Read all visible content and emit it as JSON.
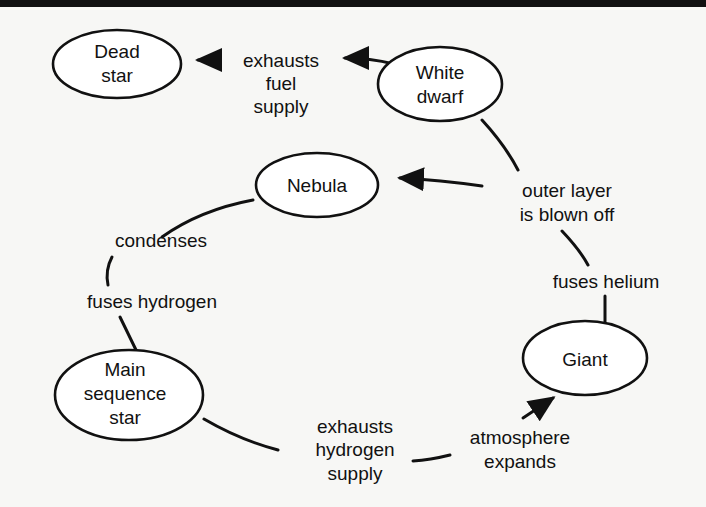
{
  "nodes": {
    "dead_star": [
      "Dead",
      "star"
    ],
    "white_dwarf": [
      "White",
      "dwarf"
    ],
    "nebula": [
      "Nebula"
    ],
    "main_sequence": [
      "Main",
      "sequence",
      "star"
    ],
    "giant": [
      "Giant"
    ]
  },
  "edges": {
    "exhausts_fuel": [
      "exhausts",
      "fuel",
      "supply"
    ],
    "outer_layer": [
      "outer layer",
      "is blown off"
    ],
    "condenses": [
      "condenses"
    ],
    "fuses_hydrogen": [
      "fuses hydrogen"
    ],
    "fuses_helium": [
      "fuses helium"
    ],
    "exhausts_hydrogen": [
      "exhausts",
      "hydrogen",
      "supply"
    ],
    "atmosphere": [
      "atmosphere",
      "expands"
    ]
  }
}
